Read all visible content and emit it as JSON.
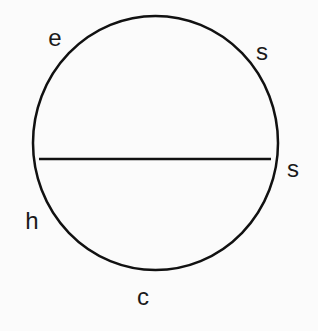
{
  "diagram": {
    "circle": {
      "cx": 155.5,
      "cy": 143,
      "rx": 122.5,
      "ry": 127,
      "stroke": "#111111",
      "stroke_width": 2.5
    },
    "chord": {
      "x1": 39,
      "y1": 159,
      "x2": 271,
      "y2": 159,
      "stroke": "#111111",
      "stroke_width": 2.5
    },
    "labels": [
      {
        "id": "e",
        "text": "e",
        "x": 55,
        "y": 38
      },
      {
        "id": "s-top",
        "text": "s",
        "x": 262,
        "y": 52
      },
      {
        "id": "s-right",
        "text": "s",
        "x": 293,
        "y": 169
      },
      {
        "id": "h",
        "text": "h",
        "x": 32,
        "y": 221
      },
      {
        "id": "c",
        "text": "c",
        "x": 143,
        "y": 297
      }
    ]
  }
}
